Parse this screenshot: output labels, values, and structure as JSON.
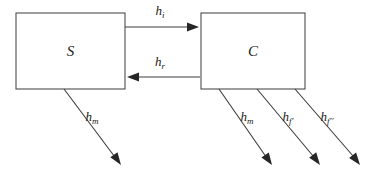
{
  "diagram": {
    "title": "",
    "type": "node-link-diagram",
    "colors": {
      "background": "#ffffff",
      "box_stroke": "#4d4d4d",
      "edge_stroke": "#3d3d3d",
      "arrowhead": "#262626",
      "text": "#1a1a1a"
    },
    "nodes": [
      {
        "id": "S",
        "label": "S",
        "shape": "rectangle",
        "x": 16,
        "y": 13,
        "width": 109,
        "height": 76
      },
      {
        "id": "C",
        "label": "C",
        "shape": "rectangle",
        "x": 201,
        "y": 13,
        "width": 104,
        "height": 76
      }
    ],
    "edges": [
      {
        "id": "h_i",
        "base": "h",
        "sub": "i",
        "label": "hi",
        "from": "S",
        "to": "C",
        "direction": "right",
        "x1": 125,
        "y1": 27,
        "x2": 199,
        "y2": 27,
        "label_x": 160,
        "label_y": 15
      },
      {
        "id": "h_r",
        "base": "h",
        "sub": "r",
        "label": "hr",
        "from": "C",
        "to": "S",
        "direction": "left",
        "x1": 200,
        "y1": 77,
        "x2": 127,
        "y2": 77,
        "label_x": 160,
        "label_y": 66
      },
      {
        "id": "h_m_S",
        "base": "h",
        "sub": "m",
        "label": "hm",
        "from": "S",
        "to": "",
        "direction": "down-right",
        "x1": 64,
        "y1": 89,
        "x2": 121,
        "y2": 165,
        "label_x": 92,
        "label_y": 121
      },
      {
        "id": "h_m_C",
        "base": "h",
        "sub": "m",
        "label": "hm",
        "from": "C",
        "to": "",
        "direction": "down-right",
        "x1": 219,
        "y1": 89,
        "x2": 272,
        "y2": 165,
        "label_x": 247,
        "label_y": 121
      },
      {
        "id": "h_f_prime",
        "base": "h",
        "sub": "f'",
        "label": "hf'",
        "from": "C",
        "to": "",
        "direction": "down-right",
        "x1": 257,
        "y1": 89,
        "x2": 320,
        "y2": 165,
        "label_x": 288,
        "label_y": 121
      },
      {
        "id": "h_f_double_prime",
        "base": "h",
        "sub": "f''",
        "label": "hf''",
        "from": "C",
        "to": "",
        "direction": "down-right",
        "x1": 295,
        "y1": 89,
        "x2": 360,
        "y2": 165,
        "label_x": 327,
        "label_y": 121
      }
    ]
  }
}
